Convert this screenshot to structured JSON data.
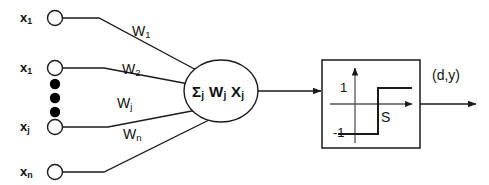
{
  "diagram": {
    "colors": {
      "stroke": "#1a1a1a",
      "fill_open": "#ffffff",
      "fill_solid": "#000000",
      "background": "#ffffff"
    },
    "inputs": [
      {
        "label_base": "x",
        "label_sub": "1",
        "name": "input-node-x1"
      },
      {
        "label_base": "x",
        "label_sub": "1",
        "name": "input-node-x1-second"
      },
      {
        "label_base": "x",
        "label_sub": "j",
        "name": "input-node-xj"
      },
      {
        "label_base": "x",
        "label_sub": "n",
        "name": "input-node-xn"
      }
    ],
    "ellipsis": {
      "name": "vertical-ellipsis",
      "dot_count": 3
    },
    "weights": [
      {
        "label_base": "W",
        "label_sub": "1"
      },
      {
        "label_base": "W",
        "label_sub": "2"
      },
      {
        "label_base": "W",
        "label_sub": "j"
      },
      {
        "label_base": "W",
        "label_sub": "n"
      }
    ],
    "summation": {
      "sigma": "Σ",
      "sigma_sub": "j",
      "term1_base": "W",
      "term1_sub": "j",
      "term2_base": "X",
      "term2_sub": "j"
    },
    "activation": {
      "name": "sign-step-activation",
      "upper_level": "1",
      "lower_level": "-1",
      "threshold_label": "S"
    },
    "output": {
      "label": "(d,y)"
    }
  }
}
